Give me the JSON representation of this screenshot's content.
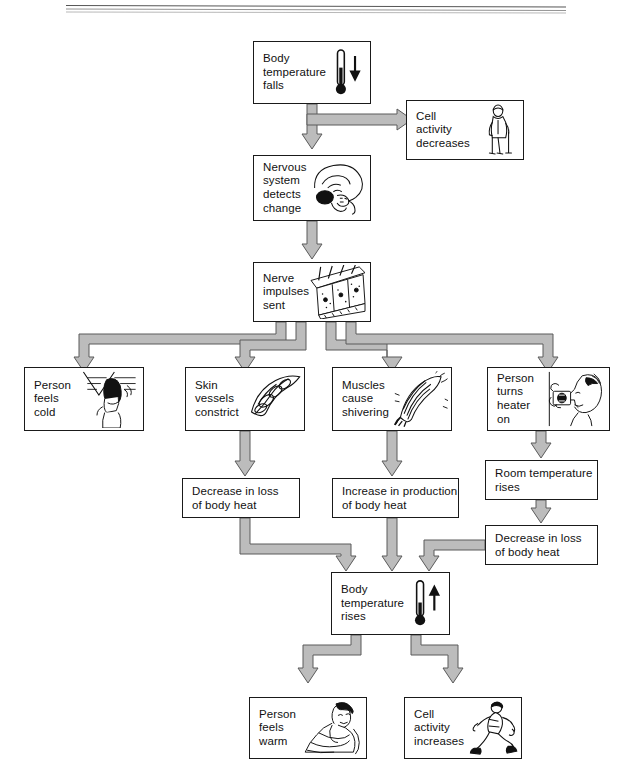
{
  "diagram": {
    "colors": {
      "box_border": "#1a1a1a",
      "arrow_fill": "#b9b9b9",
      "arrow_stroke": "#555555",
      "background": "#ffffff",
      "text": "#111111"
    },
    "header_rule": "double-rule",
    "nodes": [
      {
        "id": "body-temp-falls",
        "label": "Body\ntemperature\nfalls",
        "icon": "thermometer-down-icon",
        "x": 253,
        "y": 41,
        "w": 118,
        "h": 63
      },
      {
        "id": "cell-activity-decreases",
        "label": "Cell\nactivity\ndecreases",
        "icon": "elderly-person-icon",
        "x": 406,
        "y": 100,
        "w": 118,
        "h": 60
      },
      {
        "id": "nervous-system-detects",
        "label": "Nervous\nsystem\ndetects\nchange",
        "icon": "brain-icon",
        "x": 253,
        "y": 155,
        "w": 118,
        "h": 66
      },
      {
        "id": "nerve-impulses-sent",
        "label": "Nerve\nimpulses\nsent",
        "icon": "nerve-cells-icon",
        "x": 253,
        "y": 262,
        "w": 118,
        "h": 60
      },
      {
        "id": "person-feels-cold",
        "label": "Person\nfeels\ncold",
        "icon": "cold-person-icon",
        "x": 24,
        "y": 367,
        "w": 120,
        "h": 64
      },
      {
        "id": "skin-vessels-constrict",
        "label": "Skin\nvessels\nconstrict",
        "icon": "blood-vessel-icon",
        "x": 185,
        "y": 367,
        "w": 120,
        "h": 64
      },
      {
        "id": "muscles-cause-shivering",
        "label": "Muscles\ncause\nshivering",
        "icon": "muscle-icon",
        "x": 332,
        "y": 367,
        "w": 120,
        "h": 64
      },
      {
        "id": "person-turns-heater-on",
        "label": "Person\nturns\nheater\non",
        "icon": "heater-person-icon",
        "x": 487,
        "y": 367,
        "w": 123,
        "h": 64
      },
      {
        "id": "room-temperature-rises",
        "label": "Room temperature\nrises",
        "icon": "",
        "x": 485,
        "y": 460,
        "w": 113,
        "h": 40
      },
      {
        "id": "decrease-loss-left",
        "label": "Decrease in loss\nof body heat",
        "icon": "",
        "x": 182,
        "y": 478,
        "w": 118,
        "h": 40
      },
      {
        "id": "increase-production",
        "label": "Increase in production\nof body heat",
        "icon": "",
        "x": 332,
        "y": 478,
        "w": 127,
        "h": 40
      },
      {
        "id": "decrease-loss-right",
        "label": "Decrease in loss\nof body heat",
        "icon": "",
        "x": 485,
        "y": 525,
        "w": 113,
        "h": 40
      },
      {
        "id": "body-temp-rises",
        "label": "Body\ntemperature\nrises",
        "icon": "thermometer-up-icon",
        "x": 331,
        "y": 572,
        "w": 119,
        "h": 63
      },
      {
        "id": "person-feels-warm",
        "label": "Person\nfeels\nwarm",
        "icon": "resting-person-icon",
        "x": 249,
        "y": 697,
        "w": 118,
        "h": 62
      },
      {
        "id": "cell-activity-increases",
        "label": "Cell\nactivity\nincreases",
        "icon": "running-person-icon",
        "x": 404,
        "y": 697,
        "w": 118,
        "h": 62
      }
    ],
    "connections": [
      {
        "from": "body-temp-falls",
        "to": "cell-activity-decreases",
        "kind": "elbow-right"
      },
      {
        "from": "body-temp-falls",
        "to": "nervous-system-detects",
        "kind": "straight-down"
      },
      {
        "from": "nervous-system-detects",
        "to": "nerve-impulses-sent",
        "kind": "straight-down"
      },
      {
        "from": "nerve-impulses-sent",
        "to": "person-feels-cold",
        "kind": "branch-left-far"
      },
      {
        "from": "nerve-impulses-sent",
        "to": "skin-vessels-constrict",
        "kind": "branch-left-near"
      },
      {
        "from": "nerve-impulses-sent",
        "to": "muscles-cause-shivering",
        "kind": "branch-right-near"
      },
      {
        "from": "nerve-impulses-sent",
        "to": "person-turns-heater-on",
        "kind": "branch-right-far"
      },
      {
        "from": "skin-vessels-constrict",
        "to": "decrease-loss-left",
        "kind": "straight-down"
      },
      {
        "from": "muscles-cause-shivering",
        "to": "increase-production",
        "kind": "straight-down"
      },
      {
        "from": "person-turns-heater-on",
        "to": "room-temperature-rises",
        "kind": "straight-down"
      },
      {
        "from": "room-temperature-rises",
        "to": "decrease-loss-right",
        "kind": "straight-down"
      },
      {
        "from": "decrease-loss-left",
        "to": "body-temp-rises",
        "kind": "elbow-down-right"
      },
      {
        "from": "increase-production",
        "to": "body-temp-rises",
        "kind": "straight-down"
      },
      {
        "from": "decrease-loss-right",
        "to": "body-temp-rises",
        "kind": "elbow-down-left"
      },
      {
        "from": "body-temp-rises",
        "to": "person-feels-warm",
        "kind": "elbow-down-left"
      },
      {
        "from": "body-temp-rises",
        "to": "cell-activity-increases",
        "kind": "elbow-down-right"
      }
    ]
  }
}
